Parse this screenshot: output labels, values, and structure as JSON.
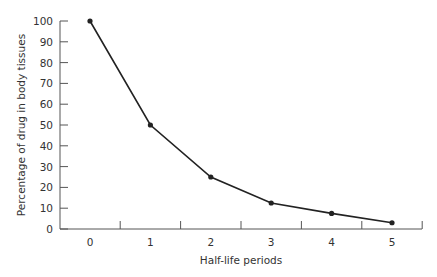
{
  "chart_data": {
    "type": "line",
    "title": "",
    "xlabel": "Half-life periods",
    "ylabel": "Percentage of drug in body tissues",
    "categories": [
      "0",
      "1",
      "2",
      "3",
      "4",
      "5"
    ],
    "x": [
      0,
      1,
      2,
      3,
      4,
      5
    ],
    "series": [
      {
        "name": "Drug remaining",
        "values": [
          100,
          50,
          25,
          12.5,
          7.5,
          3
        ]
      }
    ],
    "yticks": [
      0,
      10,
      20,
      30,
      40,
      50,
      60,
      70,
      80,
      90,
      100
    ],
    "ylim": [
      0,
      100
    ],
    "grid": false,
    "legend": "none",
    "colors": {
      "line": "#222222",
      "axis": "#555555",
      "text": "#333333"
    }
  }
}
